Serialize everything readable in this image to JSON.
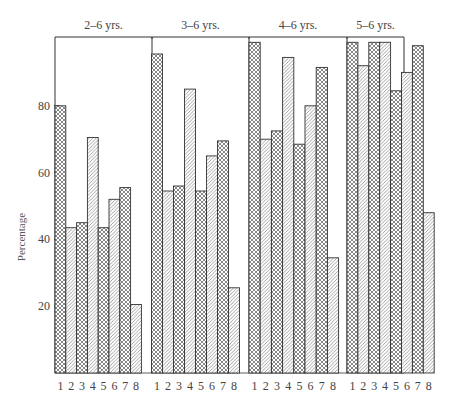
{
  "chart_data": {
    "type": "bar",
    "title": "",
    "xlabel": "",
    "ylabel": "Percentage",
    "ylim": [
      0,
      100
    ],
    "yticks": [
      20,
      40,
      60,
      80
    ],
    "grid": false,
    "legend": null,
    "categories": [
      "1",
      "2",
      "3",
      "4",
      "5",
      "6",
      "7",
      "8"
    ],
    "pattern_note": "odd-numbered bars cross-hatched, even-numbered bars diagonal-hatched",
    "panels": [
      {
        "title": "2–6 yrs.",
        "values": [
          80,
          43.5,
          45,
          70.5,
          43.5,
          52,
          55.5,
          20.5
        ]
      },
      {
        "title": "3–6 yrs.",
        "values": [
          95.5,
          54.5,
          56,
          85,
          54.5,
          65,
          69.5,
          25.5
        ]
      },
      {
        "title": "4–6 yrs.",
        "values": [
          99,
          70,
          72.5,
          94.5,
          68.5,
          80,
          91.5,
          34.5
        ]
      },
      {
        "title": "5–6 yrs.",
        "values": [
          99,
          92,
          99,
          99,
          84.5,
          90,
          98,
          48
        ]
      }
    ]
  },
  "colors": {
    "ink": "#333333",
    "background": "#ffffff"
  }
}
